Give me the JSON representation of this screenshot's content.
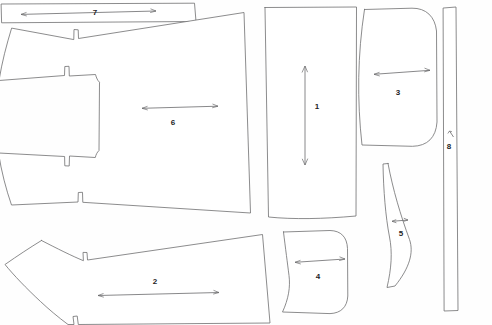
{
  "diagram": {
    "type": "garment-pattern-nesting-diagram",
    "background_color": "#fefefe",
    "outline_color": "#6e6e70",
    "arrow_color": "#6a6a6c",
    "label_color": "#1d1d1f",
    "canvas": {
      "width": 492,
      "height": 325
    }
  },
  "pieces": [
    {
      "id": "piece-1",
      "label": "1",
      "shape": "tall-rectangle",
      "description": "Large upright rectangular panel, center-right",
      "label_position": {
        "x": 317,
        "y": 107
      },
      "grain_arrow": {
        "orientation": "vertical",
        "double_headed": true,
        "x1": 305,
        "y1": 66,
        "x2": 305,
        "y2": 165
      }
    },
    {
      "id": "piece-2",
      "label": "2",
      "shape": "elongated-wing",
      "description": "Long tapering wing-shaped panel, bottom-left",
      "label_position": {
        "x": 155,
        "y": 282
      },
      "grain_arrow": {
        "orientation": "horizontal",
        "double_headed": true,
        "x1": 98,
        "y1": 295,
        "x2": 219,
        "y2": 293
      }
    },
    {
      "id": "piece-3",
      "label": "3",
      "shape": "rounded-panel",
      "description": "Rounded-corner panel, upper right",
      "label_position": {
        "x": 398,
        "y": 93
      },
      "grain_arrow": {
        "orientation": "horizontal",
        "double_headed": true,
        "x1": 374,
        "y1": 74,
        "x2": 430,
        "y2": 70
      }
    },
    {
      "id": "piece-4",
      "label": "4",
      "shape": "rounded-cuff",
      "description": "Small rounded cuff panel, bottom center",
      "label_position": {
        "x": 318,
        "y": 277
      },
      "grain_arrow": {
        "orientation": "horizontal",
        "double_headed": true,
        "x1": 295,
        "y1": 262,
        "x2": 345,
        "y2": 259
      }
    },
    {
      "id": "piece-5",
      "label": "5",
      "shape": "curved-crescent",
      "description": "Narrow curved crescent strip, right of center-bottom",
      "label_position": {
        "x": 401,
        "y": 234
      },
      "grain_arrow": {
        "orientation": "horizontal",
        "double_headed": true,
        "x1": 392,
        "y1": 221,
        "x2": 408,
        "y2": 220
      }
    },
    {
      "id": "piece-6",
      "label": "6",
      "shape": "large-notched-body",
      "description": "Largest body panel with notched tab on left edge",
      "label_position": {
        "x": 173,
        "y": 123
      },
      "grain_arrow": {
        "orientation": "horizontal",
        "double_headed": true,
        "x1": 142,
        "y1": 108,
        "x2": 218,
        "y2": 106
      }
    },
    {
      "id": "piece-7",
      "label": "7",
      "shape": "long-thin-strip",
      "description": "Long horizontal narrow band strip across the top-left",
      "label_position": {
        "x": 95,
        "y": 13
      },
      "grain_arrow": {
        "orientation": "horizontal",
        "double_headed": true,
        "x1": 21,
        "y1": 14,
        "x2": 156,
        "y2": 11
      }
    },
    {
      "id": "piece-8",
      "label": "8",
      "shape": "tall-thin-strip",
      "description": "Tall narrow vertical band strip on far right",
      "label_position": {
        "x": 449,
        "y": 147
      },
      "grain_arrow": {
        "orientation": "vertical-short",
        "double_headed": true,
        "x1": 450,
        "y1": 131,
        "x2": 453,
        "y2": 137
      }
    }
  ]
}
